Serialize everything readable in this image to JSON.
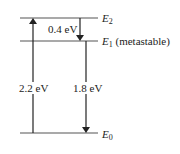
{
  "diagram": {
    "type": "energy-level-diagram",
    "levels": [
      {
        "id": "E2",
        "symbol": "E",
        "subscript": "2",
        "note": ""
      },
      {
        "id": "E1",
        "symbol": "E",
        "subscript": "1",
        "note": "(metastable)"
      },
      {
        "id": "E0",
        "symbol": "E",
        "subscript": "0",
        "note": ""
      }
    ],
    "transitions": [
      {
        "from": "E0",
        "to": "E2",
        "direction": "up",
        "label": "2.2 eV"
      },
      {
        "from": "E2",
        "to": "E1",
        "direction": "down",
        "label": "0.4 eV"
      },
      {
        "from": "E1",
        "to": "E0",
        "direction": "down",
        "label": "1.8 eV"
      }
    ],
    "colors": {
      "line": "#555555",
      "arrow": "#222222",
      "text": "#222222"
    }
  }
}
